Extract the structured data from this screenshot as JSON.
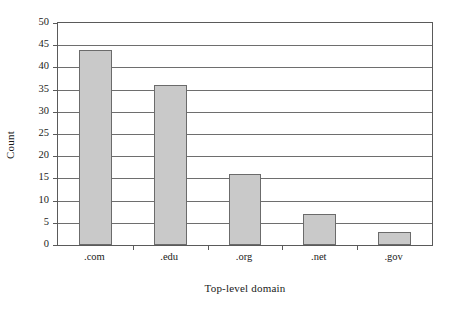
{
  "chart_data": {
    "type": "bar",
    "title": "",
    "categories": [
      ".com",
      ".edu",
      ".org",
      ".net",
      ".gov"
    ],
    "values": [
      44,
      36,
      16,
      7,
      3
    ],
    "xlabel": "Top-level domain",
    "ylabel": "Count",
    "ylim": [
      0,
      50
    ],
    "yticks": [
      0,
      5,
      10,
      15,
      20,
      25,
      30,
      35,
      40,
      45,
      50
    ],
    "ytick_labels": [
      "0",
      "5",
      "10",
      "15",
      "20",
      "25",
      "30",
      "35",
      "40",
      "45",
      "50"
    ],
    "grid": true,
    "grid_axis": "y",
    "legend": null,
    "bar_color": "#c9c9c9",
    "bar_edge_color": "#6b6b6b",
    "axis_color": "#5a5a5a",
    "background_color": "#ffffff"
  }
}
